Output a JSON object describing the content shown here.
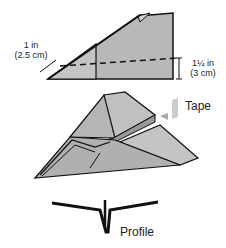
{
  "diagram": {
    "step1": {
      "left_measure": {
        "line1": "1 in",
        "line2": "(2.5 cm)"
      },
      "right_measure": {
        "line1": "1¼ in",
        "line2": "(3 cm)"
      }
    },
    "step2": {
      "tape_label": "Tape"
    },
    "step3": {
      "profile_label": "Profile"
    },
    "colors": {
      "fill": "#b8b8b8",
      "fill_light": "#d0d0d0",
      "stroke": "#111111",
      "tape": "#cccccc"
    }
  }
}
